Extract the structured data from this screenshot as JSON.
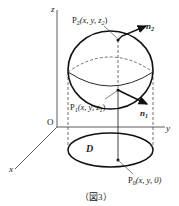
{
  "figure": {
    "caption": "（図3）",
    "axes": {
      "z_label": "z",
      "y_label": "y",
      "x_label": "x",
      "origin_label": "O"
    },
    "region_label": "D",
    "points": {
      "p2": {
        "name": "P",
        "sub": "2",
        "coords": "(x, y, z",
        "coord_sub": "2",
        "close": ")"
      },
      "p1": {
        "name": "P",
        "sub": "1",
        "coords": "(x, y, z",
        "coord_sub": "1",
        "close": ")"
      },
      "p0": {
        "name": "P",
        "sub": "0",
        "coords": "(x, y, 0)"
      }
    },
    "normals": {
      "n2": {
        "name": "n",
        "sub": "2"
      },
      "n1": {
        "name": "n",
        "sub": "1"
      }
    },
    "colors": {
      "stroke": "#111111",
      "background": "#ffffff"
    }
  }
}
